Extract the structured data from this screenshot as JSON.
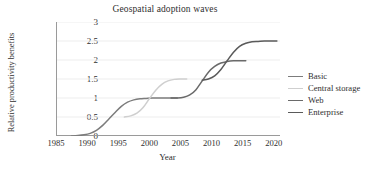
{
  "chart_data": {
    "type": "line",
    "title": "Geospatial adoption waves",
    "xlabel": "Year",
    "ylabel": "Relative productivity benefits",
    "xlim": [
      1985,
      2021
    ],
    "ylim": [
      0,
      3
    ],
    "xticks": [
      "1985",
      "1990",
      "1995",
      "2000",
      "2005",
      "2010",
      "2015",
      "2020"
    ],
    "yticks": [
      "0",
      "0.5",
      "1",
      "1.5",
      "2",
      "2.5",
      "3"
    ],
    "grid": true,
    "legend_position": "right",
    "series": [
      {
        "name": "Basic",
        "color": "#7c7c7c",
        "x": [
          1987.5,
          1988.5,
          1989.5,
          1990.5,
          1991.5,
          1992.5,
          1993.5,
          1994.5,
          1995.5,
          1996.5,
          1997.5,
          1998.5,
          1999.5,
          2000.5,
          2001.5,
          2002.5,
          2003.5,
          2004.5
        ],
        "y": [
          0.0,
          0.01,
          0.03,
          0.07,
          0.15,
          0.28,
          0.45,
          0.62,
          0.78,
          0.89,
          0.95,
          0.98,
          0.99,
          1.0,
          1.0,
          1.0,
          1.0,
          1.0
        ]
      },
      {
        "name": "Central storage",
        "color": "#cfcfcf",
        "x": [
          1996.0,
          1997.0,
          1998.0,
          1999.0,
          2000.0,
          2001.0,
          2002.0,
          2003.0,
          2004.0,
          2005.0,
          2006.0
        ],
        "y": [
          0.5,
          0.53,
          0.6,
          0.75,
          0.98,
          1.2,
          1.36,
          1.45,
          1.49,
          1.5,
          1.5
        ]
      },
      {
        "name": "Web",
        "color": "#6a6a6a",
        "x": [
          2003.5,
          2004.5,
          2005.5,
          2006.5,
          2007.5,
          2008.5,
          2009.5,
          2010.5,
          2011.5,
          2012.5,
          2013.5,
          2014.5,
          2015.5
        ],
        "y": [
          1.0,
          1.0,
          1.02,
          1.08,
          1.22,
          1.45,
          1.68,
          1.83,
          1.92,
          1.96,
          1.98,
          1.98,
          1.98
        ]
      },
      {
        "name": "Enterprise",
        "color": "#5a5a5a",
        "x": [
          2008.5,
          2009.5,
          2010.5,
          2011.5,
          2012.5,
          2013.5,
          2014.5,
          2015.5,
          2016.5,
          2017.5,
          2018.5,
          2019.5,
          2020.5
        ],
        "y": [
          1.47,
          1.5,
          1.58,
          1.75,
          1.98,
          2.2,
          2.36,
          2.44,
          2.48,
          2.49,
          2.5,
          2.5,
          2.5
        ]
      }
    ]
  },
  "legend": {
    "items": [
      {
        "label": "Basic"
      },
      {
        "label": "Central storage"
      },
      {
        "label": "Web"
      },
      {
        "label": "Enterprise"
      }
    ]
  }
}
